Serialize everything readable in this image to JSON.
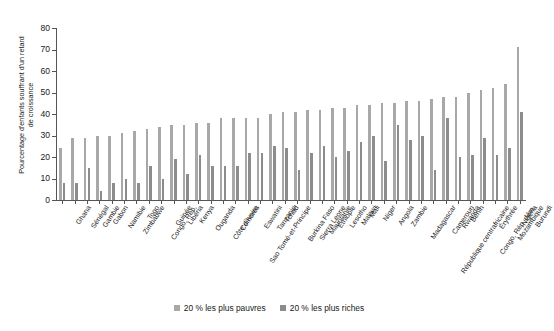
{
  "chart_data": {
    "type": "bar",
    "title": "",
    "subtitle": "",
    "xlabel": "",
    "ylabel": "Pourcentage d'enfants souffrant d'un retard de croissance",
    "ylabel_lines": [
      "Pourcentage d'enfants souffrant d'un retard",
      "de croissance"
    ],
    "ylim": [
      0,
      80
    ],
    "ytick_labels": [
      "0",
      "10",
      "20",
      "30",
      "40",
      "50",
      "60",
      "70",
      "80"
    ],
    "ytick_values": [
      0,
      10,
      20,
      30,
      40,
      50,
      60,
      70,
      80
    ],
    "grid": false,
    "legend_position": "bottom",
    "categories": [
      "Ghana",
      "Sénégal",
      "Gambie",
      "Gabon",
      "Namibie",
      "Zimbabwe",
      "Togo",
      "Congo, Rép.",
      "Guinée",
      "Libéria",
      "Kenya",
      "Ouganda",
      "Côte d'Ivoire",
      "Comores",
      "Sao Tomé-et-Principe",
      "Eswatini",
      "Tanzanie",
      "Tchad",
      "Burkina Faso",
      "Sierra Leone",
      "Mauritanie",
      "Éthiopie",
      "Lesotho",
      "Malawi",
      "Mali",
      "Niger",
      "Angola",
      "Zambie",
      "Madagascar",
      "République centrafricaine",
      "Cameroun",
      "Rwanda",
      "Bénin",
      "Congo, Rép. dém.",
      "Érythrée",
      "Mozambique",
      "Nigéria",
      "Burundi"
    ],
    "series": [
      {
        "name": "20 % les plus pauvres",
        "color": "#a8a8a8",
        "values": [
          24,
          29,
          29,
          30,
          30,
          31,
          32,
          33,
          34,
          35,
          35,
          36,
          36,
          38,
          38,
          38,
          38,
          40,
          41,
          41,
          42,
          42,
          43,
          43,
          44,
          44,
          45,
          45,
          46,
          46,
          47,
          48,
          48,
          50,
          51,
          52,
          54,
          71
        ]
      },
      {
        "name": "20 % les plus riches",
        "color": "#8c8c8c",
        "values": [
          8,
          8,
          15,
          4,
          8,
          10,
          8,
          16,
          10,
          19,
          12,
          21,
          16,
          16,
          16,
          22,
          22,
          25,
          24,
          14,
          22,
          25,
          20,
          23,
          27,
          30,
          18,
          35,
          28,
          30,
          14,
          38,
          20,
          21,
          29,
          21,
          24,
          41
        ]
      }
    ]
  },
  "legend": {
    "items": [
      {
        "label": "20 % les plus pauvres",
        "color": "#a8a8a8"
      },
      {
        "label": "20 % les plus riches",
        "color": "#8c8c8c"
      }
    ]
  }
}
